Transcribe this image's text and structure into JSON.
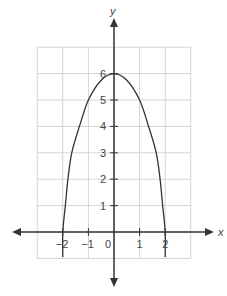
{
  "chart_data": {
    "type": "line",
    "title": "",
    "xlabel": "x",
    "ylabel": "y",
    "xlim": [
      -3,
      3
    ],
    "ylim": [
      -1,
      7
    ],
    "grid": true,
    "x_ticks": [
      -2,
      -1,
      0,
      1,
      2
    ],
    "x_tick_labels": [
      "−2",
      "−1",
      "0",
      "1",
      "2"
    ],
    "y_ticks": [
      1,
      2,
      3,
      4,
      5,
      6
    ],
    "y_tick_labels": [
      "1",
      "2",
      "3",
      "4",
      "5",
      "6"
    ],
    "series": [
      {
        "name": "curve",
        "description": "Downward-opening curve with vertex at (0, 6) and x-intercepts at (−2, 0) and (2, 0)",
        "x": [
          -2.0,
          -1.9,
          -1.8,
          -1.65,
          -1.35,
          -1.0,
          -0.5,
          0,
          0.5,
          1.0,
          1.35,
          1.65,
          1.8,
          1.9,
          2.0
        ],
        "y": [
          0,
          1.0,
          2.0,
          3.0,
          4.0,
          5.0,
          5.75,
          6,
          5.75,
          5.0,
          4.0,
          3.0,
          2.0,
          1.0,
          0
        ]
      }
    ],
    "key_points": {
      "vertex": [
        0,
        6
      ],
      "x_intercepts": [
        [
          -2,
          0
        ],
        [
          2,
          0
        ]
      ]
    }
  },
  "colors": {
    "grid": "#d4d4d4",
    "axis": "#333333",
    "curve": "#333333",
    "text": "#444444"
  }
}
